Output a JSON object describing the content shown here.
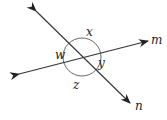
{
  "diagram": {
    "type": "intersecting-lines-angles",
    "lines": [
      {
        "name": "m",
        "label": "m",
        "from": [
          19,
          74
        ],
        "to": [
          148,
          41
        ]
      },
      {
        "name": "n",
        "label": "n",
        "from": [
          36,
          11
        ],
        "to": [
          130,
          103
        ]
      }
    ],
    "intersection": [
      82,
      57
    ],
    "arc_circle": {
      "cx": 82,
      "cy": 57,
      "r": 19
    },
    "angles": [
      {
        "label": "x",
        "pos": [
          89,
          36
        ]
      },
      {
        "label": "w",
        "pos": [
          56,
          59
        ]
      },
      {
        "label": "y",
        "pos": [
          100,
          67
        ]
      },
      {
        "label": "z",
        "pos": [
          74,
          88
        ]
      }
    ],
    "line_labels": [
      {
        "label": "m",
        "pos": [
          151,
          44
        ]
      },
      {
        "label": "n",
        "pos": [
          135,
          110
        ]
      }
    ],
    "stroke_color": "#333333"
  }
}
